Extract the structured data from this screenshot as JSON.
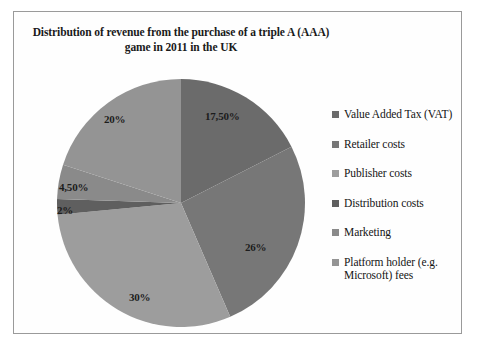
{
  "chart_data": {
    "type": "pie",
    "title": "Distribution of revenue from the purchase of a triple A (AAA) game in 2011 in the UK",
    "title_line1": "Distribution of revenue from the purchase of a triple A (AAA)",
    "title_line2": "game in 2011 in the UK",
    "categories": [
      "Value Added Tax (VAT)",
      "Retailer costs",
      "Publisher costs",
      "Distribution costs",
      "Marketing",
      "Platform holder (e.g. Microsoft) fees"
    ],
    "values": [
      17.5,
      26,
      30,
      2,
      4.5,
      20
    ],
    "data_labels": [
      "17,50%",
      "26%",
      "30%",
      "2%",
      "4,50%",
      "20%"
    ],
    "colors": [
      "#6b6b6b",
      "#777777",
      "#9d9d9d",
      "#5f5f5f",
      "#8a8a8a",
      "#949494"
    ],
    "start_angle_deg": 0,
    "direction": "clockwise",
    "legend_position": "right",
    "grid": false,
    "xlabel": "",
    "ylabel": ""
  },
  "legend": {
    "items": [
      {
        "label": "Value Added Tax (VAT)",
        "color": "#6b6b6b"
      },
      {
        "label": "Retailer costs",
        "color": "#777777"
      },
      {
        "label": "Publisher costs",
        "color": "#9d9d9d"
      },
      {
        "label": "Distribution costs",
        "color": "#5f5f5f"
      },
      {
        "label": "Marketing",
        "color": "#8a8a8a"
      },
      {
        "label": "Platform holder (e.g. Microsoft) fees",
        "color": "#949494"
      }
    ]
  }
}
